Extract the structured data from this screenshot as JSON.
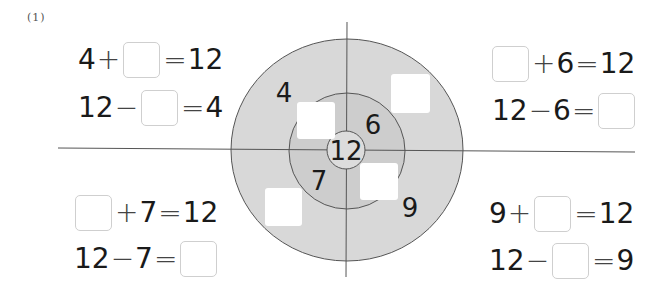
{
  "problem": {
    "number": "(1)"
  },
  "diagram": {
    "center_value": "12",
    "inner_ring": {
      "labels": [
        "6",
        "7"
      ]
    },
    "outer_ring": {
      "labels": [
        "4",
        "9"
      ]
    },
    "colors": {
      "outer_fill": "#d8d8d8",
      "inner_fill": "#cdcdcd",
      "center_fill": "#dcdcdc",
      "stroke": "#555555",
      "blank_fill": "#ffffff"
    }
  },
  "equations": {
    "top_left": [
      {
        "parts": [
          "4",
          "+",
          "□",
          "=",
          "12"
        ]
      },
      {
        "parts": [
          "12",
          "−",
          "□",
          "=",
          "4"
        ]
      }
    ],
    "top_right": [
      {
        "parts": [
          "□",
          "+",
          "6",
          "=",
          "12"
        ]
      },
      {
        "parts": [
          "12",
          "−",
          "6",
          "=",
          "□"
        ]
      }
    ],
    "bottom_left": [
      {
        "parts": [
          "□",
          "+",
          "7",
          "=",
          "12"
        ]
      },
      {
        "parts": [
          "12",
          "−",
          "7",
          "=",
          "□"
        ]
      }
    ],
    "bottom_right": [
      {
        "parts": [
          "9",
          "+",
          "□",
          "=",
          "12"
        ]
      },
      {
        "parts": [
          "12",
          "−",
          "□",
          "=",
          "9"
        ]
      }
    ]
  },
  "text": {
    "tl1_a": "4",
    "tl1_op": "+",
    "tl1_eq": "=",
    "tl1_r": "12",
    "tl2_a": "12",
    "tl2_op": "−",
    "tl2_eq": "=",
    "tl2_r": "4",
    "tr1_op": "+",
    "tr1_b": "6",
    "tr1_eq": "=",
    "tr1_r": "12",
    "tr2_a": "12",
    "tr2_op": "−",
    "tr2_b": "6",
    "tr2_eq": "=",
    "bl1_op": "+",
    "bl1_b": "7",
    "bl1_eq": "=",
    "bl1_r": "12",
    "bl2_a": "12",
    "bl2_op": "−",
    "bl2_b": "7",
    "bl2_eq": "=",
    "br1_a": "9",
    "br1_op": "+",
    "br1_eq": "=",
    "br1_r": "12",
    "br2_a": "12",
    "br2_op": "−",
    "br2_eq": "=",
    "br2_r": "9"
  }
}
